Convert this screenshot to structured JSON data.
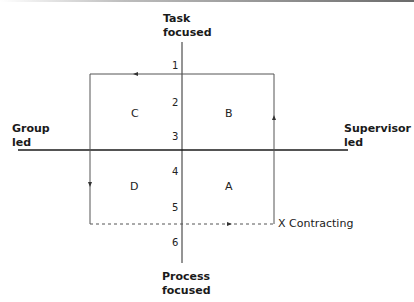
{
  "axes": {
    "vertical": {
      "top_label_line1": "Task",
      "top_label_line2": "focused",
      "bottom_label_line1": "Process",
      "bottom_label_line2": "focused"
    },
    "horizontal": {
      "left_label_line1": "Group",
      "left_label_line2": "led",
      "right_label_line1": "Supervisor",
      "right_label_line2": "led"
    }
  },
  "scale": [
    "1",
    "2",
    "3",
    "4",
    "5",
    "6"
  ],
  "quadrants": {
    "top_left": "C",
    "top_right": "B",
    "bottom_left": "D",
    "bottom_right": "A"
  },
  "contracting_label": "X Contracting",
  "colors": {
    "axis": "#2a2a2a",
    "box": "#555555"
  }
}
